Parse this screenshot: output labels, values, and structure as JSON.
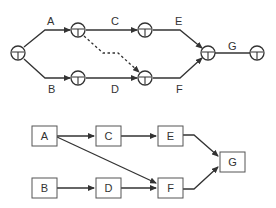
{
  "diagram": {
    "activity_on_arrow": {
      "nodes": [
        "n1",
        "n2",
        "n3",
        "n4",
        "n5",
        "n6",
        "n7"
      ],
      "activities": [
        {
          "label": "A",
          "from": "n1",
          "to": "n2",
          "dummy": false
        },
        {
          "label": "B",
          "from": "n1",
          "to": "n3",
          "dummy": false
        },
        {
          "label": "C",
          "from": "n2",
          "to": "n4",
          "dummy": false
        },
        {
          "label": "D",
          "from": "n3",
          "to": "n5",
          "dummy": false
        },
        {
          "label": "",
          "from": "n2",
          "to": "n5",
          "dummy": true
        },
        {
          "label": "E",
          "from": "n4",
          "to": "n6",
          "dummy": false
        },
        {
          "label": "F",
          "from": "n5",
          "to": "n6",
          "dummy": false
        },
        {
          "label": "G",
          "from": "n6",
          "to": "n7",
          "dummy": false
        }
      ]
    },
    "activity_on_node": {
      "nodes": [
        {
          "id": "A",
          "label": "A"
        },
        {
          "id": "B",
          "label": "B"
        },
        {
          "id": "C",
          "label": "C"
        },
        {
          "id": "D",
          "label": "D"
        },
        {
          "id": "E",
          "label": "E"
        },
        {
          "id": "F",
          "label": "F"
        },
        {
          "id": "G",
          "label": "G"
        }
      ],
      "edges": [
        {
          "from": "A",
          "to": "C"
        },
        {
          "from": "A",
          "to": "F"
        },
        {
          "from": "B",
          "to": "D"
        },
        {
          "from": "C",
          "to": "E"
        },
        {
          "from": "D",
          "to": "F"
        },
        {
          "from": "E",
          "to": "G"
        },
        {
          "from": "F",
          "to": "G"
        }
      ]
    }
  }
}
